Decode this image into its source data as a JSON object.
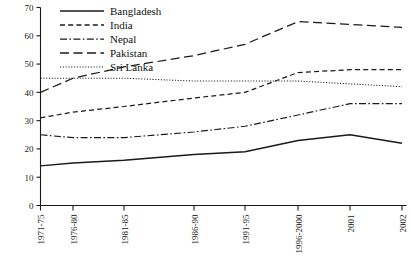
{
  "chart_data": {
    "type": "line",
    "title": "",
    "subtitle": "",
    "xlabel": "",
    "ylabel": "",
    "ylim": [
      0,
      70
    ],
    "ytick_values": [
      0,
      10,
      20,
      30,
      40,
      50,
      60,
      70
    ],
    "ytick_labels": [
      "0",
      "10",
      "20",
      "30",
      "40",
      "50",
      "60",
      "70"
    ],
    "grid": false,
    "legend_position": "top-left",
    "categories": [
      "1971-75",
      "1976-80",
      "1981-85",
      "1986-90",
      "1991-95",
      "1996-2000",
      "2001",
      "2002"
    ],
    "series": [
      {
        "name": "Bangladesh",
        "style": "solid",
        "values": [
          14,
          15,
          16,
          18,
          19,
          23,
          25,
          22
        ]
      },
      {
        "name": "India",
        "style": "dashed",
        "values": [
          31,
          33,
          35,
          38,
          40,
          47,
          48,
          48
        ]
      },
      {
        "name": "Nepal",
        "style": "dash-dot",
        "values": [
          25,
          24,
          24,
          26,
          28,
          32,
          36,
          36
        ]
      },
      {
        "name": "Pakistan",
        "style": "long-dash",
        "values": [
          40,
          45,
          49,
          53,
          57,
          65,
          64,
          63
        ]
      },
      {
        "name": "Sri Lanka",
        "style": "dotted",
        "values": [
          45,
          45,
          45,
          44,
          44,
          44,
          43,
          42
        ]
      }
    ]
  },
  "legend": {
    "entries": [
      {
        "label": "Bangladesh"
      },
      {
        "label": "India"
      },
      {
        "label": "Nepal"
      },
      {
        "label": "Pakistan"
      },
      {
        "label": "Sri Lanka"
      }
    ]
  }
}
